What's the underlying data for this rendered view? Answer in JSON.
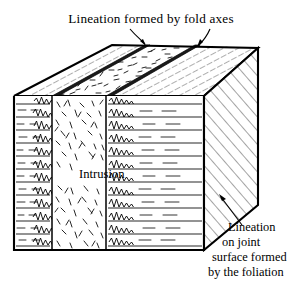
{
  "figure": {
    "kind": "geological-block-diagram",
    "title": "Lineation formed by fold axes",
    "intrusion_label": "Intrusion",
    "caption_lines": [
      "Lineation",
      "on joint",
      "surface formed",
      "by the foliation"
    ],
    "colors": {
      "ink": "#000000",
      "paper": "#ffffff",
      "fold_axis_band": "#1a1a1a"
    },
    "annotations": {
      "top_arrows_count": 2,
      "top_arrow_target": "fold-axis-band",
      "caption_arrow_target": "joint-surface-edge"
    },
    "regions": [
      {
        "name": "top-surface-left",
        "pattern": "lineation-strokes"
      },
      {
        "name": "top-surface-dike",
        "pattern": "stipple-dashes"
      },
      {
        "name": "top-surface-right",
        "pattern": "lineation-strokes"
      },
      {
        "name": "front-face-left",
        "pattern": "bedded-folded-layers"
      },
      {
        "name": "front-face-dike",
        "pattern": "stipple-dashes"
      },
      {
        "name": "front-face-right",
        "pattern": "bedded-folded-layers"
      },
      {
        "name": "right-face",
        "pattern": "foliation-hatching"
      }
    ]
  }
}
